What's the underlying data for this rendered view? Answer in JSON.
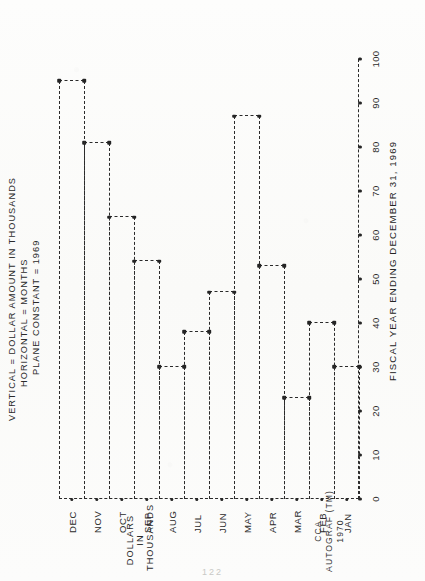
{
  "page": {
    "credit_lines": [
      "CCA",
      "AUTOGRAF (TM)",
      "1970"
    ],
    "page_number": "122"
  },
  "chart_data": {
    "type": "bar",
    "title": "ANNUAL REPORT TO STOCKHOLDERS FOR 1969",
    "subtitle_lines": [
      "VERTICAL = DOLLAR AMOUNT IN THOUSANDS",
      "HORIZONTAL = MONTHS",
      "PLANE CONSTANT = 1969"
    ],
    "xlabel": "FISCAL YEAR ENDING DECEMBER 31, 1969",
    "ylabel_lines": [
      "DOLLARS",
      "IN",
      "THOUSANDS"
    ],
    "categories": [
      "JAN",
      "FEB",
      "MAR",
      "APR",
      "MAY",
      "JUN",
      "JUL",
      "AUG",
      "SEP",
      "OCT",
      "NOV",
      "DEC"
    ],
    "values": [
      30,
      40,
      23,
      53,
      87,
      47,
      38,
      30,
      54,
      64,
      81,
      95
    ],
    "yticks": [
      0,
      10,
      20,
      30,
      40,
      50,
      60,
      70,
      80,
      90,
      100
    ],
    "ylim": [
      0,
      100
    ],
    "grid": false,
    "legend": "none",
    "line_style": "dashed-step-outline",
    "orientation": "horizontal-bars-rotated",
    "colors": {
      "ink": "#2a2a2a",
      "paper": "#fbfbfa"
    }
  }
}
